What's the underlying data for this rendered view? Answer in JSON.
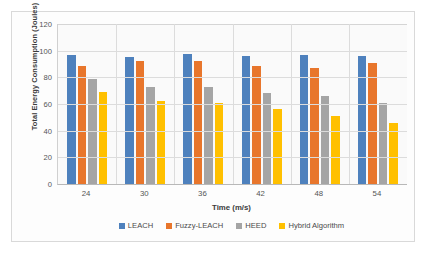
{
  "chart_data": {
    "type": "bar",
    "title": "",
    "xlabel": "Time (m/s)",
    "ylabel": "Total Energy Consumption (Joules)",
    "categories": [
      "24",
      "30",
      "36",
      "42",
      "48",
      "54"
    ],
    "ylim": [
      0,
      120
    ],
    "yticks": [
      0,
      20,
      40,
      60,
      80,
      100,
      120
    ],
    "grid": true,
    "legend_position": "bottom",
    "series": [
      {
        "name": "LEACH",
        "color": "#4E81BD",
        "values": [
          96.5,
          95.5,
          97.5,
          96.0,
          96.8,
          96.2
        ]
      },
      {
        "name": "Fuzzy-LEACH",
        "color": "#E8762C",
        "values": [
          88.8,
          92.5,
          92.2,
          88.8,
          87.0,
          90.8
        ]
      },
      {
        "name": "HEED",
        "color": "#A5A5A5",
        "values": [
          79.0,
          72.8,
          72.5,
          68.2,
          66.0,
          61.0
        ]
      },
      {
        "name": "Hybrid Algorithm",
        "color": "#FFC000",
        "values": [
          69.3,
          62.3,
          60.5,
          56.5,
          51.2,
          45.8
        ]
      }
    ]
  }
}
